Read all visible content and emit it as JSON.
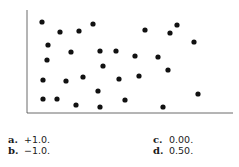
{
  "chart_data": {
    "type": "scatter",
    "title": "",
    "xlabel": "",
    "ylabel": "",
    "grid": false,
    "legend": null,
    "axis": {
      "origin_px": [
        27,
        113
      ],
      "x_end_px": 233,
      "y_top_px": 10
    },
    "point_color": "#111111",
    "points": [
      {
        "x": 42,
        "y": 22
      },
      {
        "x": 60,
        "y": 32
      },
      {
        "x": 79,
        "y": 31
      },
      {
        "x": 93,
        "y": 24
      },
      {
        "x": 145,
        "y": 30
      },
      {
        "x": 170,
        "y": 33
      },
      {
        "x": 177,
        "y": 25
      },
      {
        "x": 194,
        "y": 42
      },
      {
        "x": 48,
        "y": 45
      },
      {
        "x": 71,
        "y": 52
      },
      {
        "x": 100,
        "y": 51
      },
      {
        "x": 116,
        "y": 51
      },
      {
        "x": 135,
        "y": 56
      },
      {
        "x": 158,
        "y": 57
      },
      {
        "x": 47,
        "y": 60
      },
      {
        "x": 103,
        "y": 66
      },
      {
        "x": 168,
        "y": 70
      },
      {
        "x": 43,
        "y": 80
      },
      {
        "x": 66,
        "y": 81
      },
      {
        "x": 83,
        "y": 77
      },
      {
        "x": 119,
        "y": 79
      },
      {
        "x": 139,
        "y": 76
      },
      {
        "x": 98,
        "y": 91
      },
      {
        "x": 43,
        "y": 99
      },
      {
        "x": 57,
        "y": 99
      },
      {
        "x": 76,
        "y": 105
      },
      {
        "x": 100,
        "y": 107
      },
      {
        "x": 125,
        "y": 100
      },
      {
        "x": 163,
        "y": 107
      },
      {
        "x": 198,
        "y": 94
      }
    ],
    "note": "Points given in screen-pixel coordinates; no tick labels shown. Pattern shows no correlation."
  },
  "question": {
    "choices": [
      {
        "letter": "a.",
        "value": "+1.0."
      },
      {
        "letter": "b.",
        "value": "−1.0."
      },
      {
        "letter": "c.",
        "value": "0.00."
      },
      {
        "letter": "d.",
        "value": "0.50."
      }
    ]
  }
}
